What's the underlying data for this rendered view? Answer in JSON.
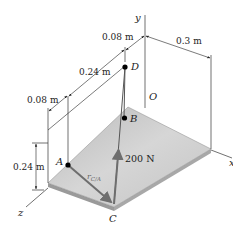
{
  "diagram": {
    "axes": {
      "y": "y",
      "z": "z",
      "x": "x",
      "origin": "O"
    },
    "points": {
      "D": "D",
      "B": "B",
      "A": "A",
      "C": "C"
    },
    "dimensions": {
      "top_offset": "0.08 m",
      "plate_width": "0.3 m",
      "depth_mid": "0.24 m",
      "left_offset": "0.08 m",
      "height": "0.24 m"
    },
    "force_label": "200 N",
    "position_vector_label": "r",
    "position_vector_sub": "C/A",
    "colors": {
      "plate_top": "#c8c8c8",
      "plate_edge": "#9a9a9a",
      "vector": "#6e6e6e",
      "line": "#333333",
      "point": "#000000"
    }
  }
}
